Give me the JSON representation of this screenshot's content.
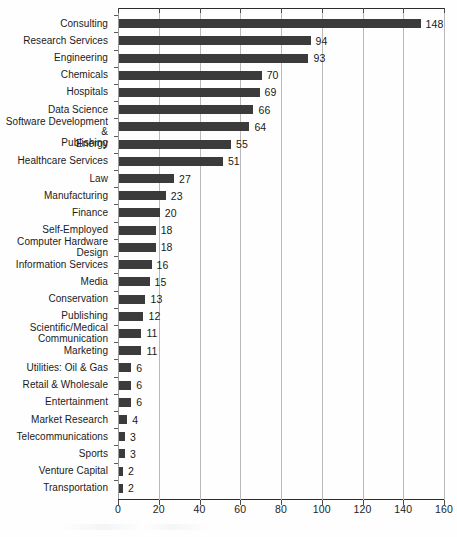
{
  "chart_data": {
    "type": "bar",
    "orientation": "horizontal",
    "title": "",
    "xlabel": "",
    "ylabel": "",
    "xlim": [
      0,
      160
    ],
    "xticks": [
      0,
      20,
      40,
      60,
      80,
      100,
      120,
      140,
      160
    ],
    "grid": "vertical",
    "legend": "none",
    "bar_color": "#3b3b3b",
    "categories": [
      "Consulting",
      "Research Services",
      "Engineering",
      "Chemicals",
      "Hospitals",
      "Data Science",
      "Software Development &\nPublishing",
      "Energy",
      "Healthcare Services",
      "Law",
      "Manufacturing",
      "Finance",
      "Self-Employed",
      "Computer Hardware\nDesign",
      "Information Services",
      "Media",
      "Conservation",
      "Publishing",
      "Scientific/Medical\nCommunication",
      "Marketing",
      "Utilities: Oil & Gas",
      "Retail & Wholesale",
      "Entertainment",
      "Market Research",
      "Telecommunications",
      "Sports",
      "Venture Capital",
      "Transportation"
    ],
    "values": [
      148,
      94,
      93,
      70,
      69,
      66,
      64,
      55,
      51,
      27,
      23,
      20,
      18,
      18,
      16,
      15,
      13,
      12,
      11,
      11,
      6,
      6,
      6,
      4,
      3,
      3,
      2,
      2
    ],
    "value_labels": [
      "148",
      "94",
      "93",
      "70",
      "69",
      "66",
      "64",
      "55",
      "51",
      "27",
      "23",
      "20",
      "18",
      "18",
      "16",
      "15",
      "13",
      "12",
      "11",
      "11",
      "6",
      "6",
      "6",
      "4",
      "3",
      "3",
      "2",
      "2"
    ]
  },
  "axis": {
    "tick_labels": [
      "0",
      "20",
      "40",
      "60",
      "80",
      "100",
      "120",
      "140",
      "160"
    ]
  }
}
